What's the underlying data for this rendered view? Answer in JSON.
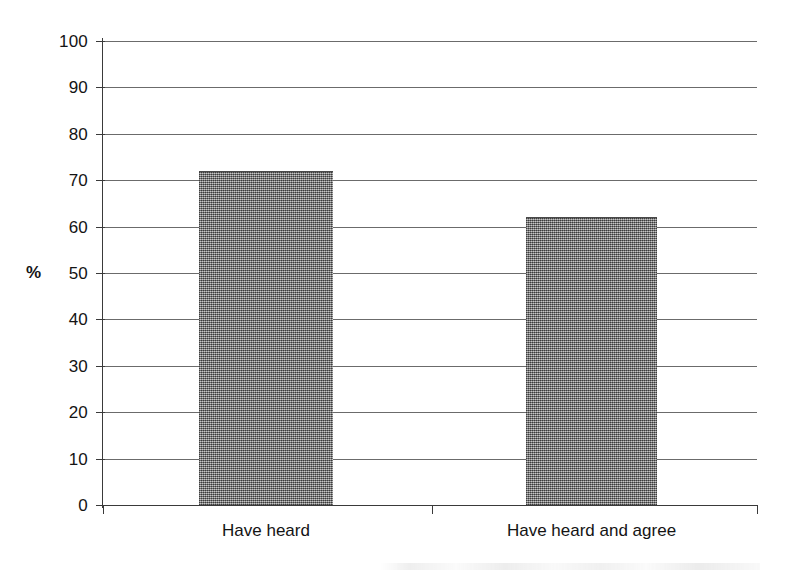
{
  "chart_data": {
    "type": "bar",
    "title": "",
    "subtitle": "",
    "xlabel": "",
    "ylabel": "%",
    "categories": [
      "Have heard",
      "Have heard and agree"
    ],
    "values": [
      72,
      62
    ],
    "series": [
      {
        "name": "",
        "values": [
          72,
          62
        ]
      }
    ],
    "ylim": [
      0,
      100
    ],
    "yticks": [
      0,
      10,
      20,
      30,
      40,
      50,
      60,
      70,
      80,
      90,
      100
    ],
    "ytick_labels": [
      "0",
      "10",
      "20",
      "30",
      "40",
      "50",
      "60",
      "70",
      "80",
      "90",
      "100"
    ],
    "grid": true,
    "grid_axis": "y",
    "legend": false,
    "legend_position": "none",
    "bar_color": "#8a8a8a",
    "bar_fill_pattern": "dithered-gray-halftone",
    "axis_color": "#3a3a3a",
    "gridline_color": "#6b6b6b",
    "background_color": "#ffffff",
    "annotations": []
  },
  "axes": {
    "y_axis_title": "%",
    "y_tick_labels": [
      "100",
      "90",
      "80",
      "70",
      "60",
      "50",
      "40",
      "30",
      "20",
      "10",
      "0"
    ],
    "x_tick_labels": [
      "Have heard",
      "Have heard and agree"
    ]
  }
}
